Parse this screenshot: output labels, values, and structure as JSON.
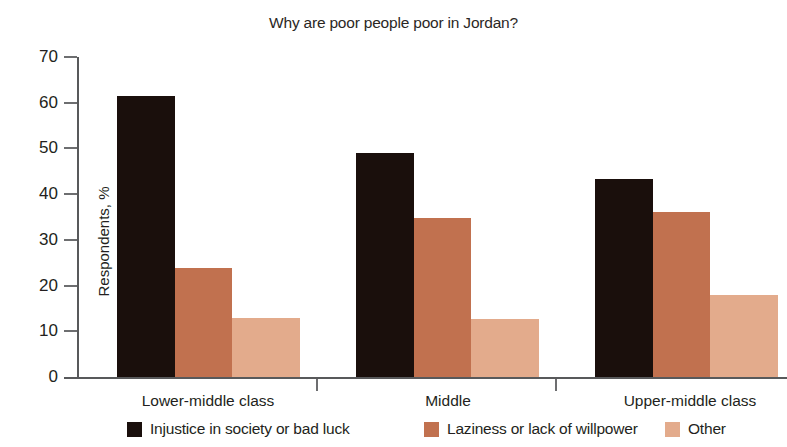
{
  "chart_data": {
    "type": "bar",
    "title": "Why are poor people poor in Jordan?",
    "xlabel": "",
    "ylabel": "Respondents, %",
    "ylim": [
      0,
      70
    ],
    "yticks": [
      0,
      10,
      20,
      30,
      40,
      50,
      60,
      70
    ],
    "grid": false,
    "legend_position": "bottom",
    "categories": [
      "Lower-middle class",
      "Middle",
      "Upper-middle class"
    ],
    "series": [
      {
        "name": "Injustice in society or bad luck",
        "color": "#1a0f0c",
        "values": [
          61.5,
          49.0,
          43.3
        ]
      },
      {
        "name": "Laziness or lack of willpower",
        "color": "#c1714f",
        "values": [
          23.8,
          34.8,
          36.1
        ]
      },
      {
        "name": "Other",
        "color": "#e3ab8c",
        "values": [
          12.9,
          12.7,
          17.9
        ]
      }
    ]
  },
  "axis": {
    "tick_labels": [
      "70",
      "60",
      "50",
      "40",
      "30",
      "20",
      "10",
      "0"
    ]
  },
  "colors": {
    "axis": "#58595b",
    "tick": "#6d6e70",
    "text": "#231f20",
    "background": "#ffffff"
  }
}
